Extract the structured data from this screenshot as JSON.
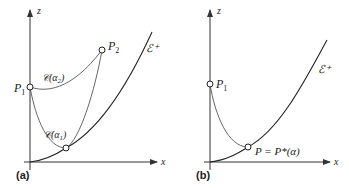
{
  "panels": [
    {
      "label": "(a)",
      "axes": {
        "x": "x",
        "z": "z"
      },
      "boundary_label": "ℰ⁺",
      "points": [
        {
          "name": "P",
          "sub": "1"
        },
        {
          "name": "P",
          "sub": "2"
        }
      ],
      "curves": [
        {
          "name": "𝒞(α",
          "sub": "2",
          "close": ")"
        },
        {
          "name": "𝒞(α",
          "sub": "1",
          "close": ")"
        }
      ]
    },
    {
      "label": "(b)",
      "axes": {
        "x": "x",
        "z": "z"
      },
      "boundary_label": "ℰ⁺",
      "points": [
        {
          "name": "P",
          "sub": "1"
        }
      ],
      "tangent_label": "P = P*(α)"
    }
  ],
  "colors": {
    "line": "#555555",
    "axis": "#333333",
    "background": "#ffffff"
  }
}
